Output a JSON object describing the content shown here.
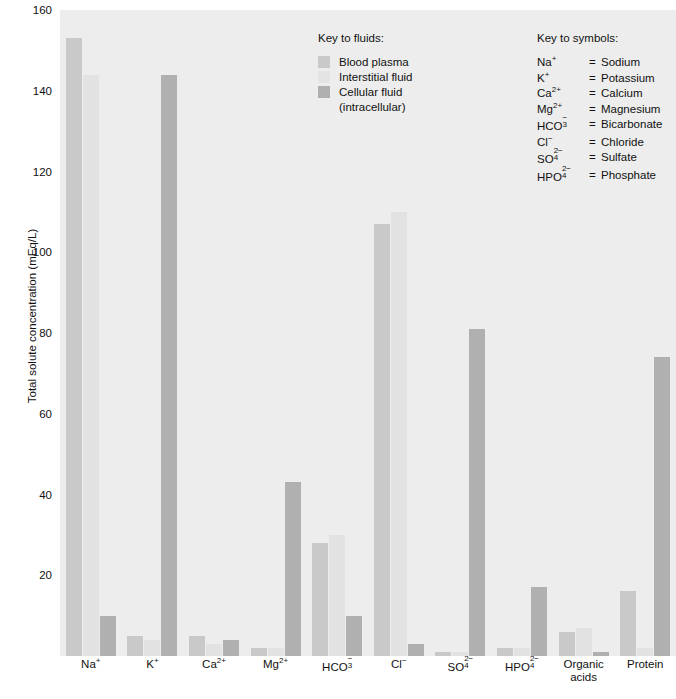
{
  "chart_data": {
    "type": "bar",
    "title": "",
    "xlabel": "",
    "ylabel": "Total solute concentration (mEq/L)",
    "ylim": [
      0,
      160
    ],
    "yticks": [
      0,
      20,
      40,
      60,
      80,
      100,
      120,
      140,
      160
    ],
    "ytick_labels": [
      "",
      "20",
      "40",
      "60",
      "80",
      "100",
      "120",
      "140",
      "160"
    ],
    "grid": false,
    "legend_position": "inside-top-center",
    "categories": [
      "Na⁺",
      "K⁺",
      "Ca²⁺",
      "Mg²⁺",
      "HCO₃⁻",
      "Cl⁻",
      "SO₄²⁻",
      "HPO₄²⁻",
      "Organic acids",
      "Protein"
    ],
    "series": [
      {
        "name": "Blood plasma",
        "values": [
          153,
          5,
          5,
          2,
          28,
          107,
          1,
          2,
          6,
          16
        ]
      },
      {
        "name": "Interstitial fluid",
        "values": [
          144,
          4,
          3,
          2,
          30,
          110,
          1,
          2,
          7,
          2
        ]
      },
      {
        "name": "Cellular fluid (intracellular)",
        "values": [
          10,
          144,
          4,
          43,
          10,
          3,
          81,
          17,
          1,
          74
        ]
      }
    ]
  },
  "axes": {
    "y_title": "Total solute concentration (mEq/L)",
    "ticks": [
      {
        "value": 160,
        "label": "160"
      },
      {
        "value": 140,
        "label": "140"
      },
      {
        "value": 120,
        "label": "120"
      },
      {
        "value": 100,
        "label": "100"
      },
      {
        "value": 80,
        "label": "80"
      },
      {
        "value": 60,
        "label": "60"
      },
      {
        "value": 40,
        "label": "40"
      },
      {
        "value": 20,
        "label": "20"
      }
    ]
  },
  "x_labels": [
    {
      "main": "Na",
      "charge": "+",
      "sub": "",
      "second": ""
    },
    {
      "main": "K",
      "charge": "+",
      "sub": "",
      "second": ""
    },
    {
      "main": "Ca",
      "charge": "2+",
      "sub": "",
      "second": ""
    },
    {
      "main": "Mg",
      "charge": "2+",
      "sub": "",
      "second": ""
    },
    {
      "main": "HCO",
      "charge": "−",
      "sub": "3",
      "second": ""
    },
    {
      "main": "Cl",
      "charge": "−",
      "sub": "",
      "second": ""
    },
    {
      "main": "SO",
      "charge": "2−",
      "sub": "4",
      "second": ""
    },
    {
      "main": "HPO",
      "charge": "2−",
      "sub": "4",
      "second": ""
    },
    {
      "main": "Organic",
      "charge": "",
      "sub": "",
      "second": "acids"
    },
    {
      "main": "Protein",
      "charge": "",
      "sub": "",
      "second": ""
    }
  ],
  "legend_fluids": {
    "title": "Key to fluids:",
    "items": [
      {
        "label": "Blood plasma",
        "sub": "",
        "color": "#c9c9c9",
        "swatch": "sw-plasma"
      },
      {
        "label": "Interstitial fluid",
        "sub": "",
        "color": "#e4e4e4",
        "swatch": "sw-interstitial"
      },
      {
        "label": "Cellular fluid",
        "sub": "(intracellular)",
        "color": "#b0b0b0",
        "swatch": "sw-cellular"
      }
    ]
  },
  "legend_symbols": {
    "title": "Key to symbols:",
    "rows": [
      {
        "formula_main": "Na",
        "formula_sub": "",
        "formula_charge": "+",
        "eq": "=",
        "name": "Sodium"
      },
      {
        "formula_main": "K",
        "formula_sub": "",
        "formula_charge": "+",
        "eq": "=",
        "name": "Potassium"
      },
      {
        "formula_main": "Ca",
        "formula_sub": "",
        "formula_charge": "2+",
        "eq": "=",
        "name": "Calcium"
      },
      {
        "formula_main": "Mg",
        "formula_sub": "",
        "formula_charge": "2+",
        "eq": "=",
        "name": "Magnesium"
      },
      {
        "formula_main": "HCO",
        "formula_sub": "3",
        "formula_charge": "−",
        "eq": "=",
        "name": "Bicarbonate"
      },
      {
        "formula_main": "Cl",
        "formula_sub": "",
        "formula_charge": "−",
        "eq": "=",
        "name": "Chloride"
      },
      {
        "formula_main": "SO",
        "formula_sub": "4",
        "formula_charge": "2−",
        "eq": "=",
        "name": "Sulfate"
      },
      {
        "formula_main": "HPO",
        "formula_sub": "4",
        "formula_charge": "2−",
        "eq": "=",
        "name": "Phosphate"
      }
    ]
  },
  "colors": {
    "plot_background": "#ededed",
    "plasma": "#c9c9c9",
    "interstitial": "#e2e2e2",
    "cellular": "#b0b0b0",
    "text": "#111111"
  }
}
